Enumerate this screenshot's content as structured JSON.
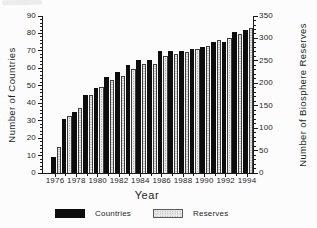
{
  "chart_data": {
    "type": "bar",
    "title": "",
    "xlabel": "Year",
    "left_axis": {
      "label": "Number of Countries",
      "min": 0,
      "max": 90,
      "major_step": 10,
      "minor_step": 2,
      "tick_labels": [
        "0",
        "10",
        "20",
        "30",
        "40",
        "50",
        "60",
        "70",
        "80",
        "90"
      ]
    },
    "right_axis": {
      "label": "Number of Biosphere Reserves",
      "min": 0,
      "max": 350,
      "major_step": 50,
      "minor_step": 10,
      "tick_labels": [
        "0",
        "50",
        "100",
        "150",
        "200",
        "250",
        "300",
        "350"
      ]
    },
    "years": [
      1976,
      1977,
      1978,
      1979,
      1980,
      1981,
      1982,
      1983,
      1984,
      1985,
      1986,
      1987,
      1988,
      1989,
      1990,
      1991,
      1992,
      1993,
      1994
    ],
    "x_tick_labels": [
      "1976",
      "1978",
      "1980",
      "1982",
      "1984",
      "1986",
      "1988",
      "1990",
      "1992",
      "1994"
    ],
    "series": [
      {
        "name": "Countries",
        "axis": "left",
        "style": "solid-black",
        "values": [
          9,
          31,
          35,
          45,
          49,
          55,
          58,
          62,
          65,
          65,
          70,
          70,
          70,
          71,
          72,
          75,
          75,
          81,
          82
        ]
      },
      {
        "name": "Reserves",
        "axis": "right",
        "style": "stippled-gray",
        "values": [
          57,
          128,
          144,
          175,
          191,
          208,
          217,
          233,
          243,
          243,
          260,
          266,
          269,
          276,
          283,
          296,
          300,
          311,
          323
        ]
      }
    ],
    "legend": [
      {
        "label": "Countries",
        "swatch": "solid-black"
      },
      {
        "label": "Reserves",
        "swatch": "stippled-gray"
      }
    ],
    "colors": {
      "bar_black": "#0d0d0d",
      "bar_gray_fill": "#e9e9e9",
      "bar_gray_dots": "#9a9a9a",
      "axis_line": "#1a1a1a",
      "text": "#1f1f1f",
      "background": "#fcfcfc"
    },
    "layout": {
      "grid": false,
      "legend_position": "bottom",
      "bars_per_year": 2
    }
  }
}
